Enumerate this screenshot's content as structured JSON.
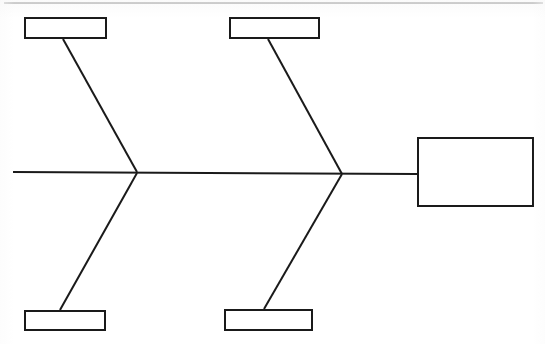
{
  "document": {
    "type": "fishbone-diagram",
    "title": "",
    "page_top_rule": true,
    "background_color": "#ffffff",
    "line_color": "#1a1a1a"
  },
  "diagram": {
    "kind": "Ishikawa cause-and-effect (fishbone) template",
    "state": "blank",
    "spine": {
      "x1": 13,
      "y1": 172,
      "x2": 417,
      "y2": 174,
      "stroke_width": 2
    },
    "junctions": [
      {
        "name": "junction-left",
        "x": 137,
        "y": 172
      },
      {
        "name": "junction-right",
        "x": 342,
        "y": 174
      }
    ],
    "effect_box": {
      "name": "effect-box",
      "label": "",
      "x": 417,
      "y": 137,
      "width": 117,
      "height": 70
    },
    "category_boxes": [
      {
        "name": "category-box-top-left",
        "label": "",
        "x": 24,
        "y": 17,
        "width": 83,
        "height": 22,
        "bone": {
          "x1": 63,
          "y1": 39,
          "x2": 137,
          "y2": 172
        }
      },
      {
        "name": "category-box-top-right",
        "label": "",
        "x": 229,
        "y": 17,
        "width": 91,
        "height": 22,
        "bone": {
          "x1": 268,
          "y1": 39,
          "x2": 342,
          "y2": 174
        }
      },
      {
        "name": "category-box-bottom-left",
        "label": "",
        "x": 24,
        "y": 310,
        "width": 82,
        "height": 21,
        "bone": {
          "x1": 60,
          "y1": 310,
          "x2": 137,
          "y2": 173
        }
      },
      {
        "name": "category-box-bottom-right",
        "label": "",
        "x": 224,
        "y": 309,
        "width": 89,
        "height": 22,
        "bone": {
          "x1": 264,
          "y1": 309,
          "x2": 342,
          "y2": 174
        }
      }
    ],
    "top_rule": {
      "name": "page-top-rule",
      "x1": 4,
      "y1": 3,
      "x2": 543,
      "y2": 3,
      "stroke_width": 1
    }
  }
}
